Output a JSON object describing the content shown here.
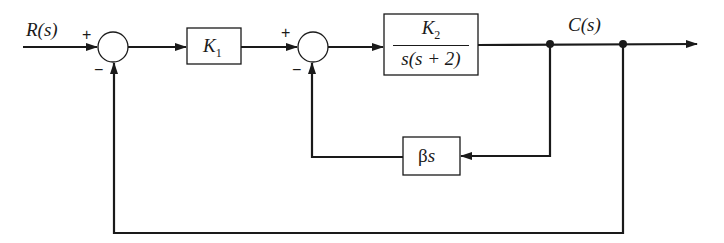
{
  "diagram": {
    "type": "control-system-block-diagram",
    "input_label": "R(s)",
    "output_label": "C(s)",
    "summing_junctions": [
      {
        "id": "sum1",
        "plus_sign": "+",
        "minus_sign": "−"
      },
      {
        "id": "sum2",
        "plus_sign": "+",
        "minus_sign": "−"
      }
    ],
    "blocks": {
      "k1": {
        "symbol": "K",
        "subscript": "1"
      },
      "plant": {
        "numerator_symbol": "K",
        "numerator_subscript": "2",
        "denominator": "s(s + 2)"
      },
      "tach": {
        "greek": "β",
        "var": "s"
      }
    },
    "connections": [
      "R(s) → sum1 (+)",
      "sum1 → K1",
      "K1 → sum2 (+)",
      "sum2 → K2/s(s+2)",
      "K2/s(s+2) → C(s)",
      "C(s) → βs → sum2 (−)",
      "C(s) → sum1 (−)"
    ],
    "colors": {
      "line": "#1a1a1a",
      "background": "#ffffff"
    }
  }
}
